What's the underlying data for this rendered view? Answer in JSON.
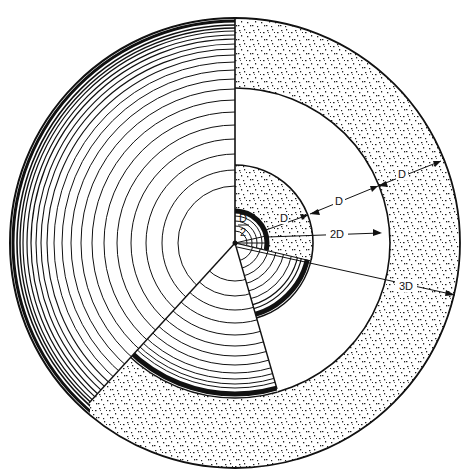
{
  "figure": {
    "type": "concentric-ring cutaway diagram",
    "colors": {
      "ink": "#111111",
      "paper": "#ffffff"
    },
    "labels": {
      "half_d_num": "D",
      "half_d_den": "2",
      "inner_d": "D",
      "middle_d": "D",
      "outer_d": "D",
      "two_d": "2D",
      "three_d": "3D"
    },
    "dimensions": [
      {
        "label": "D/2",
        "meaning": "radius of inner core"
      },
      {
        "label": "D",
        "meaning": "width of inner stippled ring"
      },
      {
        "label": "D",
        "meaning": "width of white ring"
      },
      {
        "label": "D",
        "meaning": "width of outer stippled ring"
      },
      {
        "label": "2D",
        "meaning": "radius to outer edge of white ring inner boundary"
      },
      {
        "label": "3D",
        "meaning": "radius to outer edge"
      }
    ]
  }
}
